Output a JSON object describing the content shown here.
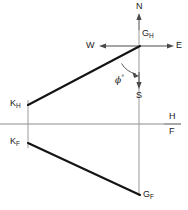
{
  "diagram": {
    "type": "orthographic-projection-with-compass",
    "background_color": "#ffffff",
    "line_color_heavy": "#1a1a1a",
    "line_color_light": "#8c8c8c",
    "labels": {
      "north": "N",
      "south": "S",
      "east": "E",
      "west": "W",
      "g_h_base": "G",
      "g_h_sub": "H",
      "g_f_base": "G",
      "g_f_sub": "F",
      "k_h_base": "K",
      "k_h_sub": "H",
      "k_f_base": "K",
      "k_f_sub": "F",
      "plane_h": "H",
      "plane_f": "F",
      "angle_symbol": "ϕ",
      "angle_degree": "°"
    },
    "points": {
      "G_H": {
        "x": 139,
        "y": 46
      },
      "G_F": {
        "x": 139,
        "y": 195
      },
      "K_H": {
        "x": 28,
        "y": 105
      },
      "K_F": {
        "x": 28,
        "y": 143
      }
    },
    "reference_line": {
      "y": 124,
      "x_start": 0,
      "x_end": 181
    },
    "vertical_axis": {
      "x": 139,
      "y_start": 14,
      "y_end": 196
    },
    "arrows": {
      "north": {
        "from_y": 28,
        "to_y": 15,
        "direction": "up"
      },
      "south": {
        "from_y": 74,
        "to_y": 88,
        "direction": "down"
      },
      "east": {
        "from_x": 150,
        "to_x": 172,
        "direction": "right"
      },
      "west": {
        "from_x": 130,
        "to_x": 104,
        "direction": "left"
      }
    }
  }
}
